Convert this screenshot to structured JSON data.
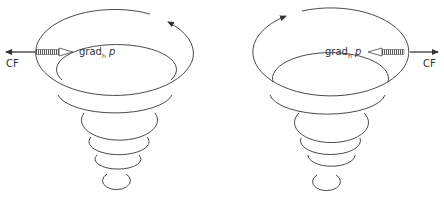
{
  "diagram": {
    "colors": {
      "stroke": "#4a4a4a",
      "background": "#ffffff"
    },
    "panels": [
      {
        "id": "left",
        "rotation": "counterclockwise",
        "labels": {
          "cf": "CF",
          "grad": "grad",
          "grad_sub": "h",
          "grad_var": "p"
        }
      },
      {
        "id": "right",
        "rotation": "clockwise",
        "labels": {
          "cf": "CF",
          "grad": "grad",
          "grad_sub": "h",
          "grad_var": "p"
        }
      }
    ]
  }
}
